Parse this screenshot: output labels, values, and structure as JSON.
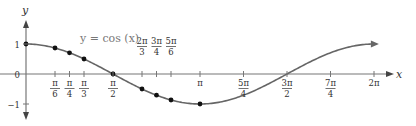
{
  "chart_data": {
    "type": "line",
    "title": "",
    "function_label": "y = cos (x)",
    "xlabel": "x",
    "ylabel": "y",
    "xlim": [
      0,
      6.2832
    ],
    "ylim": [
      -1,
      1
    ],
    "grid": false,
    "legend": "none",
    "series": [
      {
        "name": "y = cos (x)",
        "x_labels": [
          "0",
          "π/6",
          "π/4",
          "π/3",
          "π/2",
          "2π/3",
          "3π/4",
          "5π/6",
          "π"
        ],
        "x": [
          0,
          0.5236,
          0.7854,
          1.0472,
          1.5708,
          2.0944,
          2.3562,
          2.618,
          3.1416
        ],
        "y": [
          1,
          0.866,
          0.7071,
          0.5,
          0,
          -0.5,
          -0.7071,
          -0.866,
          -1
        ],
        "marked_points": true
      }
    ],
    "x_ticks": [
      {
        "label_num": "π",
        "label_den": "6",
        "value": 0.5236,
        "pos": "below"
      },
      {
        "label_num": "π",
        "label_den": "4",
        "value": 0.7854,
        "pos": "below"
      },
      {
        "label_num": "π",
        "label_den": "3",
        "value": 1.0472,
        "pos": "below"
      },
      {
        "label_num": "π",
        "label_den": "2",
        "value": 1.5708,
        "pos": "below"
      },
      {
        "label_num": "2π",
        "label_den": "3",
        "value": 2.0944,
        "pos": "above"
      },
      {
        "label_num": "3π",
        "label_den": "4",
        "value": 2.3562,
        "pos": "above"
      },
      {
        "label_num": "5π",
        "label_den": "6",
        "value": 2.618,
        "pos": "above"
      },
      {
        "label_num": "π",
        "label_den": "",
        "value": 3.1416,
        "pos": "below"
      },
      {
        "label_num": "5π",
        "label_den": "4",
        "value": 3.927,
        "pos": "below"
      },
      {
        "label_num": "3π",
        "label_den": "2",
        "value": 4.7124,
        "pos": "below"
      },
      {
        "label_num": "7π",
        "label_den": "4",
        "value": 5.4978,
        "pos": "below"
      },
      {
        "label_num": "2π",
        "label_den": "",
        "value": 6.2832,
        "pos": "below"
      }
    ],
    "y_ticks": [
      {
        "label": "1",
        "value": 1
      },
      {
        "label": "0",
        "value": 0
      },
      {
        "label": "−1",
        "value": -1
      }
    ]
  },
  "labels": {
    "x_axis": "x",
    "y_axis": "y",
    "function": "y = cos (x)"
  }
}
